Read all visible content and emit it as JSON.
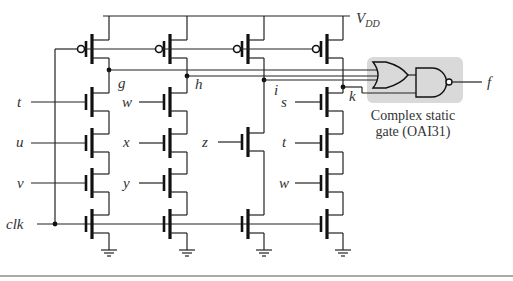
{
  "supply": {
    "label_main": "V",
    "label_sub": "DD"
  },
  "clock": {
    "label": "clk"
  },
  "nodes": [
    {
      "id": "g",
      "label": "g"
    },
    {
      "id": "h",
      "label": "h"
    },
    {
      "id": "i",
      "label": "i"
    },
    {
      "id": "k",
      "label": "k"
    }
  ],
  "columns": [
    {
      "node": "g",
      "inputs": [
        "t",
        "u",
        "v"
      ]
    },
    {
      "node": "h",
      "inputs": [
        "w",
        "x",
        "y"
      ]
    },
    {
      "node": "i",
      "inputs": [
        "z"
      ]
    },
    {
      "node": "k",
      "inputs": [
        "s",
        "t",
        "w"
      ]
    }
  ],
  "static_gate": {
    "caption_line1": "Complex static",
    "caption_line2": "gate (OAI31)",
    "box_color": "#d9d9d9",
    "or_inputs": [
      "g",
      "h",
      "i"
    ],
    "nand_inputs": [
      "or_out",
      "k"
    ],
    "output_label": "f"
  }
}
